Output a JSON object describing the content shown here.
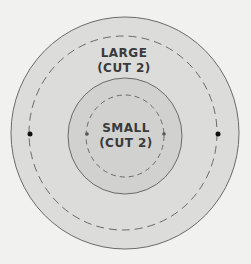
{
  "diagram": {
    "large": {
      "name": "LARGE",
      "note": "(CUT 2)"
    },
    "small": {
      "name": "SMALL",
      "note": "(CUT 2)"
    },
    "colors": {
      "background": "#f1f1ef",
      "large_fill": "#dcdcdb",
      "small_fill": "#d1d1d0",
      "outline": "#6a6a6a",
      "dot": "#111111"
    }
  }
}
